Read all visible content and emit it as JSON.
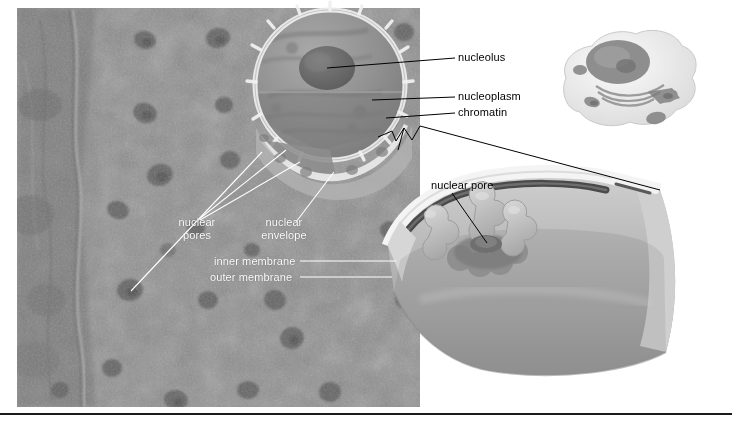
{
  "figure": {
    "background_color": "#ffffff",
    "rule_color": "#1a1a1a"
  },
  "labels": {
    "nucleolus": "nucleolus",
    "nucleoplasm": "nucleoplasm",
    "chromatin": "chromatin",
    "nuclear_pores_line1": "nuclear",
    "nuclear_pores_line2": "pores",
    "nuclear_envelope_line1": "nuclear",
    "nuclear_envelope_line2": "envelope",
    "inner_membrane": "inner membrane",
    "outer_membrane": "outer membrane",
    "nuclear_pore": "nuclear pore"
  },
  "panels": {
    "micrograph": {
      "name": "freeze-fracture electron micrograph of nuclear envelope",
      "base_color": "#8e8e8e"
    },
    "nucleus_illustration": {
      "name": "cutaway nucleus diagram",
      "nucleolus_color": "#6f6f6f",
      "nucleoplasm_color": "#949494"
    },
    "cell_inset": {
      "name": "whole cell orientation inset",
      "body_color": "#efefef"
    },
    "envelope_cutaway": {
      "name": "nuclear envelope cutaway with pore complex",
      "face_color": "#b9b9b9",
      "edge_color": "#f2f2f2",
      "lumen_color": "#4f4f4f"
    }
  },
  "colors": {
    "label_dark": "#000000",
    "label_light": "#ffffff",
    "leader_dark": "#000000",
    "leader_light": "#ffffff"
  }
}
